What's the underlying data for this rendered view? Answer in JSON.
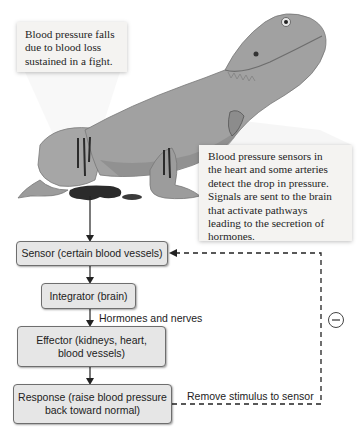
{
  "callouts": {
    "cause": {
      "lines": [
        "Blood pressure falls",
        "due to blood loss",
        "sustained in a fight."
      ]
    },
    "detection": {
      "lines": [
        "Blood pressure sensors in",
        "the heart and some arteries",
        "detect the drop in pressure.",
        "Signals are sent to the brain",
        "that activate pathways",
        "leading to the secretion of",
        "hormones."
      ]
    }
  },
  "flow": {
    "sensor": {
      "lines": [
        "Sensor (certain blood vessels)"
      ]
    },
    "integrator": {
      "lines": [
        "Integrator (brain)"
      ]
    },
    "effector": {
      "lines": [
        "Effector (kidneys, heart,",
        "blood vessels)"
      ]
    },
    "response": {
      "lines": [
        "Response (raise blood pressure",
        "back toward normal)"
      ]
    }
  },
  "labels": {
    "hormones_nerves": "Hormones and nerves",
    "remove_stimulus": "Remove stimulus to sensor",
    "negative_feedback_symbol": "−"
  },
  "illustration": {
    "subject": "bearded-dragon-lizard-bleeding",
    "colors": {
      "body": "#9a9a9a",
      "shade": "#6f6f6f",
      "blood": "#2b2b2b"
    }
  },
  "colors": {
    "box_fill": "#e6e6e6",
    "box_border": "#6e6e6e",
    "callout_fill": "#f4f3f1",
    "line": "#222222"
  }
}
